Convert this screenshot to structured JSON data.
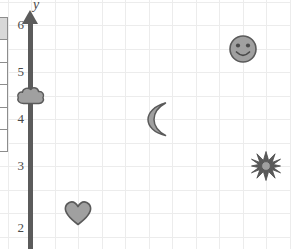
{
  "figure": {
    "kind": "coordinate-plane",
    "background_color": "#ffffff",
    "grid_color": "#ececec",
    "axis_color": "#5b5b5b",
    "marker_fill": "#a0a0a0",
    "marker_stroke": "#5a5a5a"
  },
  "axis": {
    "y_label": "y",
    "tick_labels": [
      "6",
      "5",
      "4",
      "3",
      "2"
    ],
    "tick_values": [
      6,
      5,
      4,
      3,
      2
    ]
  },
  "side_table": {
    "rows": [
      "",
      "",
      "",
      "",
      "",
      ""
    ]
  },
  "chart_data": {
    "type": "scatter",
    "title": "",
    "xlabel": "",
    "ylabel": "y",
    "xlim": [
      0,
      5.5
    ],
    "ylim": [
      1.75,
      6.2
    ],
    "grid": true,
    "grid_step": 0.5,
    "legend": "none",
    "x_ticks": [],
    "y_ticks": [
      2,
      3,
      4,
      5,
      6
    ],
    "y_tick_labels": [
      "2",
      "3",
      "4",
      "5",
      "6"
    ],
    "points": [
      {
        "label": "smiley-face",
        "x": 4.5,
        "y": 5.5
      },
      {
        "label": "cloud",
        "x": 0.0,
        "y": 4.5
      },
      {
        "label": "crescent-moon",
        "x": 2.7,
        "y": 4.0
      },
      {
        "label": "sun-star",
        "x": 5.0,
        "y": 3.0
      },
      {
        "label": "heart",
        "x": 1.0,
        "y": 2.0
      }
    ]
  }
}
